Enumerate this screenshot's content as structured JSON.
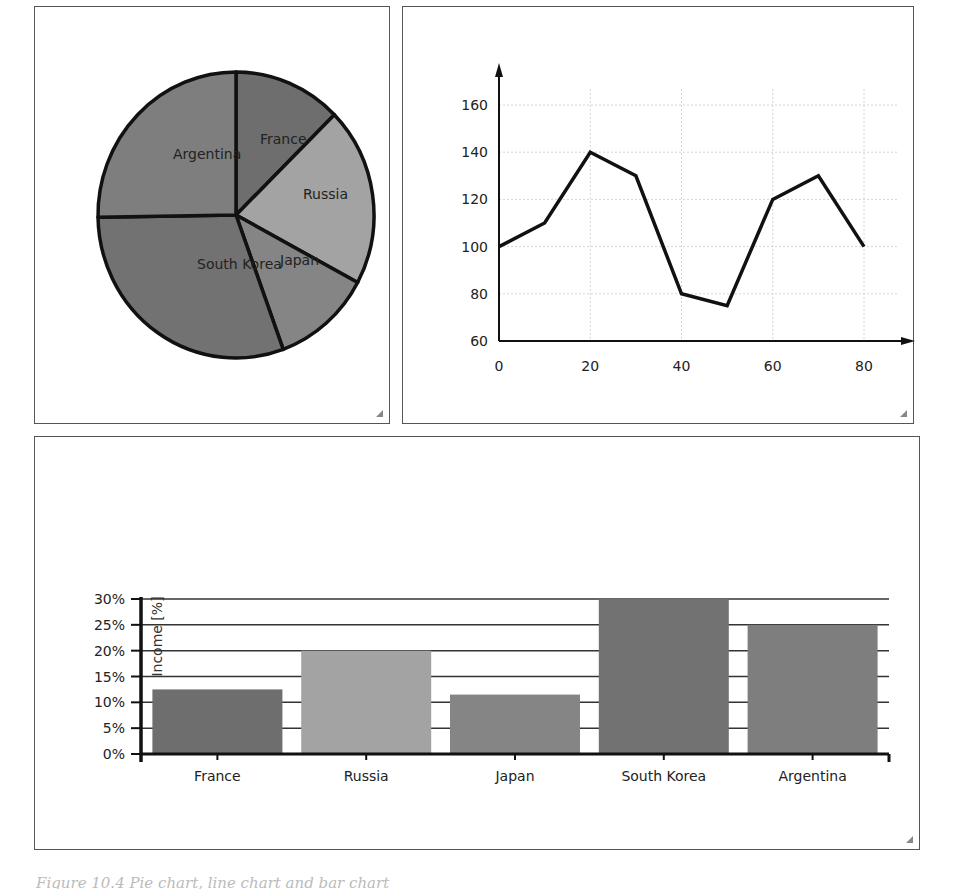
{
  "colors": {
    "France": "#6e6e6e",
    "Russia": "#a3a3a3",
    "Japan": "#858585",
    "South Korea": "#727272",
    "Argentina": "#7e7e7e",
    "outline": "#111111",
    "grid": "#d4d4d4"
  },
  "chart_data": [
    {
      "type": "pie",
      "title": "",
      "categories": [
        "France",
        "Russia",
        "Japan",
        "South Korea",
        "Argentina"
      ],
      "values": [
        12.5,
        20,
        11.5,
        30,
        25
      ],
      "start": "top, clockwise"
    },
    {
      "type": "line",
      "title": "",
      "xlabel": "",
      "ylabel": "",
      "x": [
        0,
        10,
        20,
        30,
        40,
        50,
        60,
        70,
        80
      ],
      "series": [
        {
          "name": "series1",
          "values": [
            100,
            110,
            140,
            130,
            80,
            75,
            120,
            130,
            100
          ]
        }
      ],
      "xlim": [
        0,
        88
      ],
      "ylim": [
        60,
        175
      ],
      "xticks": [
        0,
        20,
        40,
        60,
        80
      ],
      "yticks": [
        60,
        80,
        100,
        120,
        140,
        160
      ],
      "grid": true
    },
    {
      "type": "bar",
      "title": "",
      "xlabel": "",
      "ylabel": "Income [%]",
      "categories": [
        "France",
        "Russia",
        "Japan",
        "South Korea",
        "Argentina"
      ],
      "values": [
        12.5,
        20,
        11.5,
        30,
        25
      ],
      "ylim": [
        0,
        30
      ],
      "yticks": [
        "0%",
        "5%",
        "10%",
        "15%",
        "20%",
        "25%",
        "30%"
      ],
      "grid": true
    }
  ],
  "caption": "Figure 10.4  Pie chart, line chart and bar chart"
}
